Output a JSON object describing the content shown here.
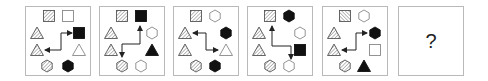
{
  "puzzle": {
    "panels": [
      {
        "index": 1,
        "shapes": [
          {
            "type": "square",
            "fill": "hatch",
            "x": 23,
            "y": 9
          },
          {
            "type": "square",
            "fill": "outline",
            "x": 42,
            "y": 9
          },
          {
            "type": "triangle",
            "fill": "hatch",
            "x": 11,
            "y": 26
          },
          {
            "type": "square",
            "fill": "black",
            "x": 53,
            "y": 26
          },
          {
            "type": "triangle",
            "fill": "hatch",
            "x": 11,
            "y": 43
          },
          {
            "type": "triangle",
            "fill": "outline",
            "x": 53,
            "y": 43
          },
          {
            "type": "hexagon",
            "fill": "hatch",
            "x": 21,
            "y": 59
          },
          {
            "type": "hexagon",
            "fill": "black",
            "x": 42,
            "y": 59
          }
        ],
        "arrow": {
          "points": [
            [
              19,
              43
            ],
            [
              35,
              43
            ],
            [
              35,
              26
            ],
            [
              46,
              26
            ]
          ],
          "heads": [
            "start",
            "end"
          ]
        }
      },
      {
        "index": 2,
        "shapes": [
          {
            "type": "square",
            "fill": "hatch",
            "x": 22,
            "y": 9
          },
          {
            "type": "square",
            "fill": "black",
            "x": 41,
            "y": 9
          },
          {
            "type": "triangle",
            "fill": "hatch",
            "x": 11,
            "y": 26
          },
          {
            "type": "hexagon",
            "fill": "outline",
            "x": 52,
            "y": 26
          },
          {
            "type": "triangle",
            "fill": "hatch",
            "x": 11,
            "y": 43
          },
          {
            "type": "triangle",
            "fill": "black",
            "x": 52,
            "y": 43
          },
          {
            "type": "hexagon",
            "fill": "hatch",
            "x": 22,
            "y": 59
          },
          {
            "type": "hexagon",
            "fill": "outline",
            "x": 41,
            "y": 59
          }
        ],
        "arrow": {
          "points": [
            [
              40,
              19
            ],
            [
              40,
              37
            ],
            [
              22,
              37
            ],
            [
              22,
              50
            ]
          ],
          "heads": [
            "start",
            "end"
          ]
        }
      },
      {
        "index": 3,
        "shapes": [
          {
            "type": "square",
            "fill": "hatch",
            "x": 22,
            "y": 9
          },
          {
            "type": "hexagon",
            "fill": "outline",
            "x": 41,
            "y": 9
          },
          {
            "type": "triangle",
            "fill": "hatch",
            "x": 11,
            "y": 26
          },
          {
            "type": "hexagon",
            "fill": "black",
            "x": 52,
            "y": 26
          },
          {
            "type": "triangle",
            "fill": "hatch",
            "x": 11,
            "y": 43
          },
          {
            "type": "triangle",
            "fill": "outline",
            "x": 52,
            "y": 43
          },
          {
            "type": "hexagon",
            "fill": "hatch",
            "x": 22,
            "y": 59
          },
          {
            "type": "hexagon",
            "fill": "black",
            "x": 41,
            "y": 59
          }
        ],
        "arrow": {
          "points": [
            [
              19,
              26
            ],
            [
              32,
              26
            ],
            [
              32,
              43
            ],
            [
              44,
              43
            ]
          ],
          "heads": [
            "start",
            "end"
          ]
        }
      },
      {
        "index": 4,
        "shapes": [
          {
            "type": "square",
            "fill": "hatch",
            "x": 22,
            "y": 9
          },
          {
            "type": "hexagon",
            "fill": "black",
            "x": 41,
            "y": 9
          },
          {
            "type": "triangle",
            "fill": "hatch",
            "x": 11,
            "y": 26
          },
          {
            "type": "hexagon",
            "fill": "outline",
            "x": 52,
            "y": 26
          },
          {
            "type": "triangle",
            "fill": "hatch",
            "x": 11,
            "y": 43
          },
          {
            "type": "square",
            "fill": "black",
            "x": 52,
            "y": 43
          },
          {
            "type": "hexagon",
            "fill": "hatch",
            "x": 22,
            "y": 59
          },
          {
            "type": "hexagon",
            "fill": "outline",
            "x": 41,
            "y": 59
          }
        ],
        "arrow": {
          "points": [
            [
              24,
              19
            ],
            [
              24,
              39
            ],
            [
              43,
              39
            ],
            [
              43,
              52
            ]
          ],
          "heads": [
            "start",
            "end"
          ]
        }
      },
      {
        "index": 5,
        "shapes": [
          {
            "type": "square",
            "fill": "hatch-rev",
            "x": 22,
            "y": 9
          },
          {
            "type": "hexagon",
            "fill": "outline",
            "x": 41,
            "y": 9
          },
          {
            "type": "triangle",
            "fill": "hatch",
            "x": 11,
            "y": 26
          },
          {
            "type": "hexagon",
            "fill": "black",
            "x": 52,
            "y": 26
          },
          {
            "type": "triangle",
            "fill": "hatch",
            "x": 11,
            "y": 43
          },
          {
            "type": "square",
            "fill": "outline",
            "x": 52,
            "y": 43
          },
          {
            "type": "hexagon",
            "fill": "hatch",
            "x": 22,
            "y": 59
          },
          {
            "type": "triangle",
            "fill": "black",
            "x": 41,
            "y": 59
          }
        ],
        "arrow": {
          "points": [
            [
              19,
              43
            ],
            [
              33,
              43
            ],
            [
              33,
              26
            ],
            [
              44,
              26
            ]
          ],
          "heads": [
            "start",
            "end"
          ]
        }
      }
    ],
    "answer_panel": {
      "label": "?"
    },
    "colors": {
      "stroke": "#555555",
      "black": "#111111",
      "border": "#b9b9b9",
      "arrow": "#222222"
    }
  }
}
